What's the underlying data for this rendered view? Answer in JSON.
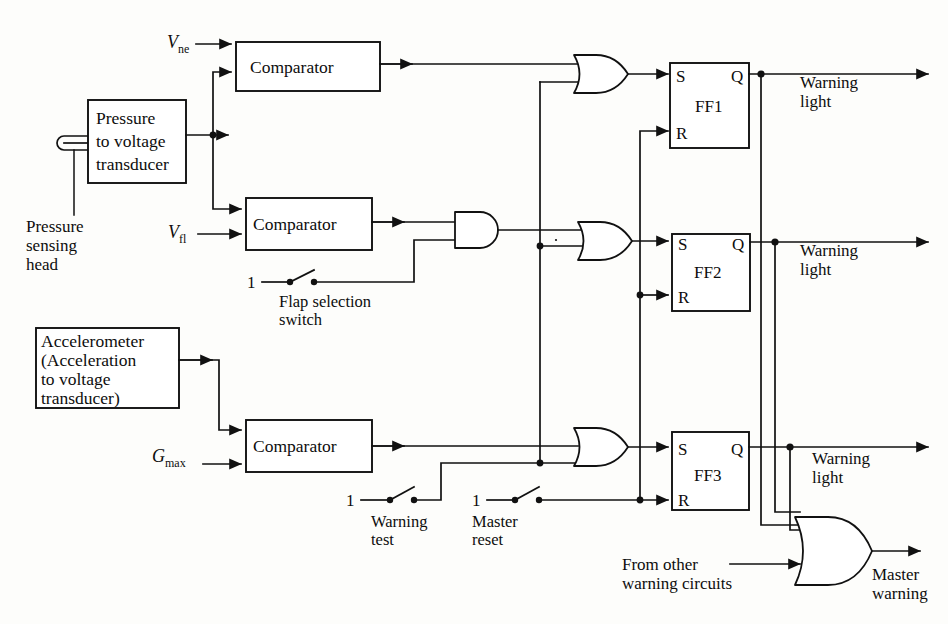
{
  "diagram": {
    "background_color": "#fdfdfb",
    "line_color": "#111111"
  },
  "sensors": {
    "pressure_head_label": "Pressure\nsensing\nhead",
    "pressure_head_line1": "Pressure",
    "pressure_head_line2": "sensing",
    "pressure_head_line3": "head",
    "pressure_transducer_line1": "Pressure",
    "pressure_transducer_line2": "to voltage",
    "pressure_transducer_line3": "transducer",
    "accelerometer_line1": "Accelerometer",
    "accelerometer_line2": "(Acceleration",
    "accelerometer_line3": "to voltage",
    "accelerometer_line4": "transducer)"
  },
  "comparators": [
    {
      "id": "comp1",
      "label": "Comparator",
      "reference_input": "V",
      "reference_sub": "ne"
    },
    {
      "id": "comp2",
      "label": "Comparator",
      "reference_input": "V",
      "reference_sub": "fl"
    },
    {
      "id": "comp3",
      "label": "Comparator",
      "reference_input": "G",
      "reference_sub": "max"
    }
  ],
  "references": {
    "vne_symbol": "V",
    "vne_subscript": "ne",
    "vfl_symbol": "V",
    "vfl_subscript": "fl",
    "gmax_symbol": "G",
    "gmax_subscript": "max"
  },
  "gates": {
    "and_gate_label": "AND",
    "or1_label": "OR",
    "or2_label": "OR",
    "or3_label": "OR",
    "master_or_label": "OR"
  },
  "flipflops": [
    {
      "name": "FF1",
      "set_pin": "S",
      "reset_pin": "R",
      "q_pin": "Q"
    },
    {
      "name": "FF2",
      "set_pin": "S",
      "reset_pin": "R",
      "q_pin": "Q"
    },
    {
      "name": "FF3",
      "set_pin": "S",
      "reset_pin": "R",
      "q_pin": "Q"
    }
  ],
  "switches": [
    {
      "id": "flap",
      "source_value": "1",
      "label_line1": "Flap selection",
      "label_line2": "switch"
    },
    {
      "id": "warning-test",
      "source_value": "1",
      "label_line1": "Warning",
      "label_line2": "test"
    },
    {
      "id": "master-reset",
      "source_value": "1",
      "label_line1": "Master",
      "label_line2": "reset"
    }
  ],
  "outputs": [
    {
      "id": "warning-light-1",
      "line1": "Warning",
      "line2": "light"
    },
    {
      "id": "warning-light-2",
      "line1": "Warning",
      "line2": "light"
    },
    {
      "id": "warning-light-3",
      "line1": "Warning",
      "line2": "light"
    },
    {
      "id": "master-warning",
      "line1": "Master",
      "line2": "warning"
    }
  ],
  "external_input": {
    "line1": "From other",
    "line2": "warning circuits"
  }
}
